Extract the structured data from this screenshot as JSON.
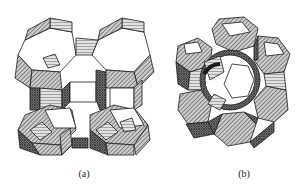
{
  "figure": {
    "panels": [
      {
        "id": "a",
        "label": "(a)",
        "description": "zeolite framework of sodalite cages linked through double 4-rings (LTA-type)"
      },
      {
        "id": "b",
        "label": "(b)",
        "description": "ring of sodalite cages linked through hexagonal prisms forming a supercage (FAU-type)"
      }
    ]
  },
  "colors": {
    "line": "#1a1a1a",
    "face_light": "#ffffff",
    "hatch_mid": "#9a9a9a",
    "hatch_dark": "#555555"
  }
}
